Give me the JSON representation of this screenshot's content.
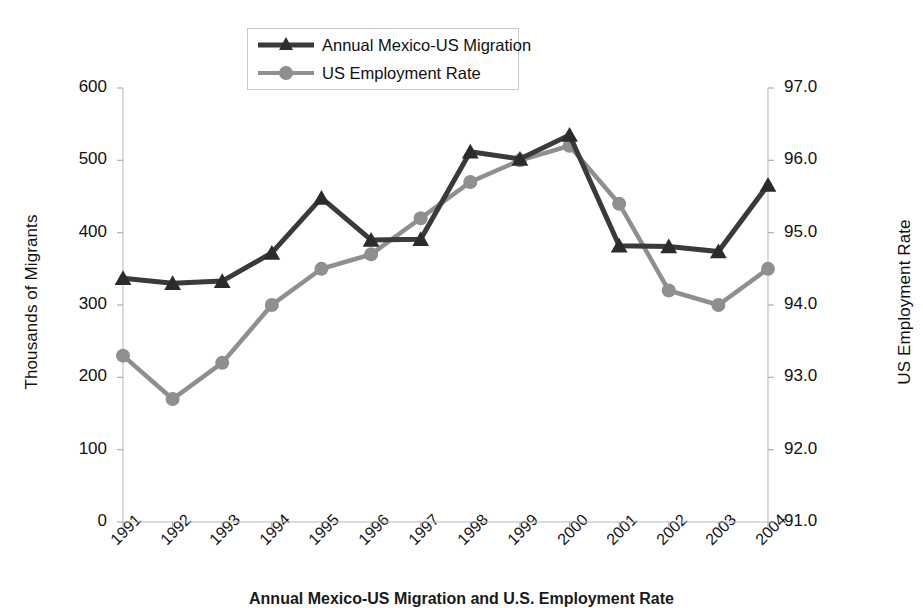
{
  "chart_data": {
    "type": "line",
    "title": "",
    "categories": [
      "1991",
      "1992",
      "1993",
      "1994",
      "1995",
      "1996",
      "1997",
      "1998",
      "1999",
      "2000",
      "2001",
      "2002",
      "2003",
      "2004"
    ],
    "xlabel": "",
    "series": [
      {
        "name": "Annual Mexico-US Migration",
        "axis": "left",
        "marker": "triangle",
        "color": "#3a3a3a",
        "values": [
          337,
          330,
          333,
          372,
          448,
          390,
          391,
          512,
          502,
          535,
          382,
          381,
          374,
          466
        ]
      },
      {
        "name": "US Employment Rate",
        "axis": "right",
        "marker": "circle",
        "color": "#8f8f8f",
        "values": [
          93.3,
          92.7,
          93.2,
          94.0,
          94.5,
          94.7,
          95.2,
          95.7,
          96.0,
          96.2,
          95.4,
          94.2,
          94.0,
          94.5
        ]
      }
    ],
    "y_left": {
      "label": "Thousands of Migrants",
      "ticks": [
        "0",
        "100",
        "200",
        "300",
        "400",
        "500",
        "600"
      ],
      "min": 0,
      "max": 600
    },
    "y_right": {
      "label": "US Employment Rate",
      "ticks": [
        "91.0",
        "92.0",
        "93.0",
        "94.0",
        "95.0",
        "96.0",
        "97.0"
      ],
      "min": 91.0,
      "max": 97.0
    },
    "legend": {
      "position": "top-center",
      "entries": [
        {
          "label": "Annual Mexico-US Migration"
        },
        {
          "label": "US Employment Rate"
        }
      ]
    },
    "grid": false
  },
  "caption": {
    "text": "Annual Mexico-US Migration and U.S. Employment Rate"
  }
}
